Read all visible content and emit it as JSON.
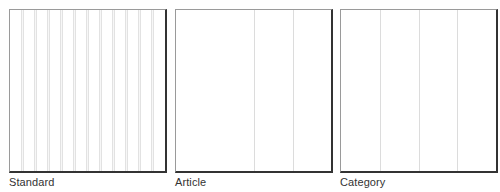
{
  "layouts": [
    {
      "id": "standard",
      "label": "Standard",
      "left": 9,
      "grid": {
        "type": "gutters",
        "columns": 12
      }
    },
    {
      "id": "article",
      "label": "Article",
      "left": 175,
      "grid": {
        "type": "lines",
        "positions": [
          78,
          117
        ]
      }
    },
    {
      "id": "category",
      "label": "Category",
      "left": 340,
      "grid": {
        "type": "lines",
        "positions": [
          39,
          78,
          116
        ]
      }
    }
  ],
  "colors": {
    "frame_light": "#9a9a9a",
    "frame_shadow": "#333333",
    "grid_line": "#dcdcdc",
    "label_text": "#333333"
  }
}
